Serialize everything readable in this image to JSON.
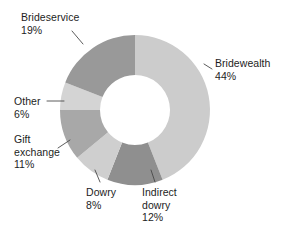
{
  "chart_data": {
    "type": "pie",
    "variant": "donut",
    "title": "",
    "subtitle": "",
    "xlabel": "",
    "ylabel": "",
    "legend_position": "outside-labels",
    "grid": false,
    "units": "percent",
    "total": 100,
    "categories": [
      "Bridewealth",
      "Indirect dowry",
      "Dowry",
      "Gift exchange",
      "Other",
      "Brideservice"
    ],
    "values": [
      44,
      12,
      8,
      11,
      6,
      19
    ],
    "slices": [
      {
        "label": "Bridewealth",
        "value": 44,
        "value_text": "44%",
        "color": "#cccccc",
        "label_lines": [
          "Bridewealth",
          "44%"
        ]
      },
      {
        "label": "Indirect dowry",
        "value": 12,
        "value_text": "12%",
        "color": "#8f8f8f",
        "label_lines": [
          "Indirect",
          "dowry",
          "12%"
        ]
      },
      {
        "label": "Dowry",
        "value": 8,
        "value_text": "8%",
        "color": "#cfcfcf",
        "label_lines": [
          "Dowry",
          "8%"
        ]
      },
      {
        "label": "Gift exchange",
        "value": 11,
        "value_text": "11%",
        "color": "#a8a8a8",
        "label_lines": [
          "Gift",
          "exchange",
          "11%"
        ]
      },
      {
        "label": "Other",
        "value": 6,
        "value_text": "6%",
        "color": "#d4d4d4",
        "label_lines": [
          "Other",
          "6%"
        ]
      },
      {
        "label": "Brideservice",
        "value": 19,
        "value_text": "19%",
        "color": "#999999",
        "label_lines": [
          "Brideservice",
          "19%"
        ]
      }
    ]
  },
  "labels": {
    "brideservice": {
      "name": "Brideservice",
      "pct": "19%"
    },
    "bridewealth": {
      "name": "Bridewealth",
      "pct": "44%"
    },
    "other": {
      "name": "Other",
      "pct": "6%"
    },
    "gift": {
      "name_line1": "Gift",
      "name_line2": "exchange",
      "pct": "11%"
    },
    "dowry": {
      "name": "Dowry",
      "pct": "8%"
    },
    "indirect": {
      "name_line1": "Indirect",
      "name_line2": "dowry",
      "pct": "12%"
    }
  },
  "style": {
    "background": "#ffffff",
    "text_color": "#1d1d1d",
    "leader_color": "#4a4a4a"
  }
}
